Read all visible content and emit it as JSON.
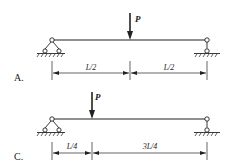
{
  "diagrams": [
    {
      "option_label": "A.",
      "load_label": "P",
      "segments": [
        {
          "label": "L/2"
        },
        {
          "label": "L/2"
        }
      ]
    },
    {
      "option_label": "C.",
      "load_label": "P",
      "segments": [
        {
          "label": "L/4"
        },
        {
          "label": "3L/4"
        }
      ]
    }
  ],
  "colors": {
    "stroke": "#222222",
    "background": "#ffffff"
  }
}
